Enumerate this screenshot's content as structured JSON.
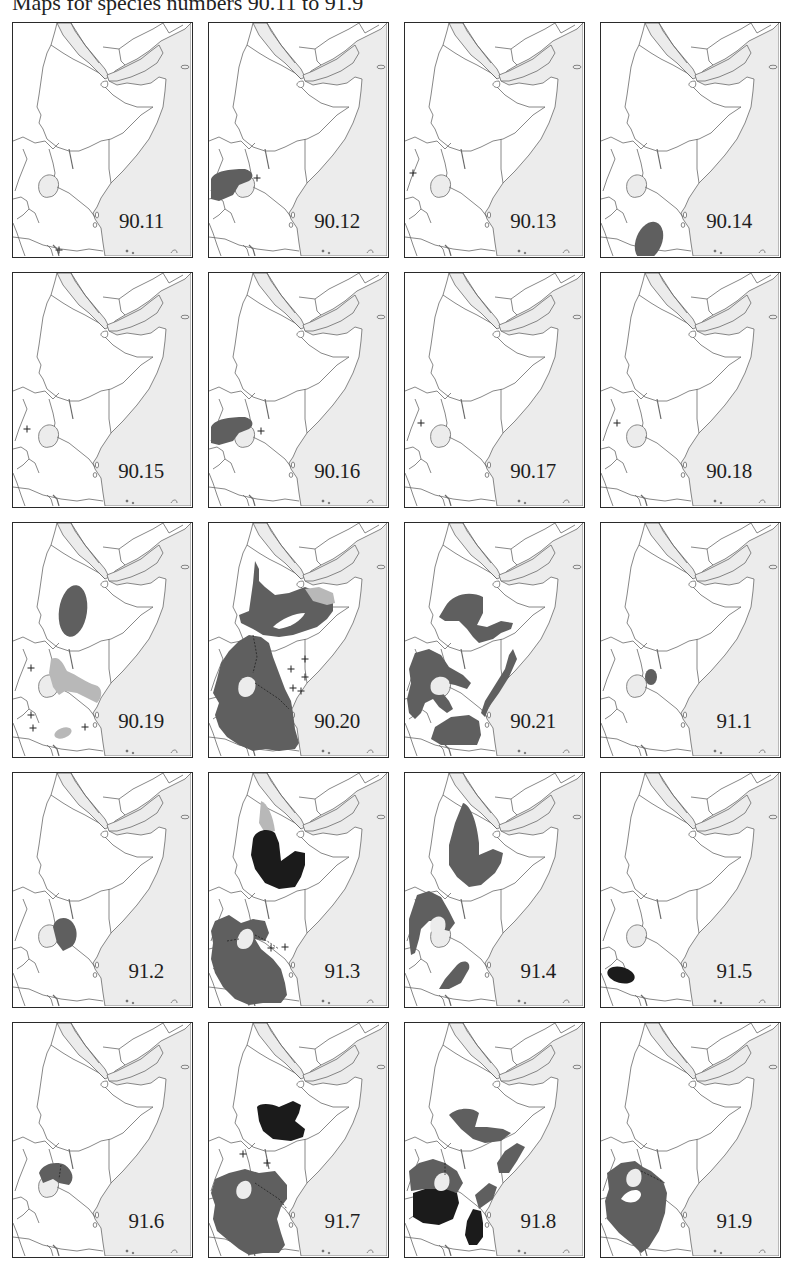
{
  "title": "Maps for species numbers 90.11 to 91.9",
  "colors": {
    "sea": "#ececec",
    "land": "#ffffff",
    "border": "#555555",
    "range_dark": "#5f5f5f",
    "range_black": "#1b1b1b",
    "range_light": "#b8b8b8",
    "frame": "#2a2a2a"
  },
  "legend_symbols": {
    "cross": "isolated record (+)",
    "dark_fill": "range",
    "black_fill": "range (second form)",
    "light_fill": "uncertain / marginal range"
  },
  "maps": [
    {
      "label": "90.11",
      "row": 0,
      "col": 0,
      "crosses": 1
    },
    {
      "label": "90.12",
      "row": 0,
      "col": 1,
      "crosses": 1
    },
    {
      "label": "90.13",
      "row": 0,
      "col": 2,
      "crosses": 1
    },
    {
      "label": "90.14",
      "row": 0,
      "col": 3,
      "crosses": 0
    },
    {
      "label": "90.15",
      "row": 1,
      "col": 0,
      "crosses": 1
    },
    {
      "label": "90.16",
      "row": 1,
      "col": 1,
      "crosses": 1
    },
    {
      "label": "90.17",
      "row": 1,
      "col": 2,
      "crosses": 1
    },
    {
      "label": "90.18",
      "row": 1,
      "col": 3,
      "crosses": 1
    },
    {
      "label": "90.19",
      "row": 2,
      "col": 0,
      "crosses": 4
    },
    {
      "label": "90.20",
      "row": 2,
      "col": 1,
      "crosses": 5
    },
    {
      "label": "90.21",
      "row": 2,
      "col": 2,
      "crosses": 0
    },
    {
      "label": "91.1",
      "row": 2,
      "col": 3,
      "crosses": 0
    },
    {
      "label": "91.2",
      "row": 3,
      "col": 0,
      "crosses": 0
    },
    {
      "label": "91.3",
      "row": 3,
      "col": 1,
      "crosses": 2
    },
    {
      "label": "91.4",
      "row": 3,
      "col": 2,
      "crosses": 0
    },
    {
      "label": "91.5",
      "row": 3,
      "col": 3,
      "crosses": 0
    },
    {
      "label": "91.6",
      "row": 4,
      "col": 0,
      "crosses": 0
    },
    {
      "label": "91.7",
      "row": 4,
      "col": 1,
      "crosses": 2
    },
    {
      "label": "91.8",
      "row": 4,
      "col": 2,
      "crosses": 0
    },
    {
      "label": "91.9",
      "row": 4,
      "col": 3,
      "crosses": 0
    }
  ]
}
